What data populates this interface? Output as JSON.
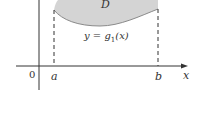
{
  "diagram": {
    "region_label": "D",
    "lower_curve_label_y": "y",
    "lower_curve_label_eq": " = ",
    "lower_curve_label_g": "g",
    "lower_curve_label_sub": "1",
    "lower_curve_label_arg": "(x)",
    "origin_label": "0",
    "a_label": "a",
    "b_label": "b",
    "x_axis_label": "x",
    "colors": {
      "region_fill": "#d4d4d4",
      "region_edge": "#8a8a8a",
      "axis": "#333333"
    }
  }
}
